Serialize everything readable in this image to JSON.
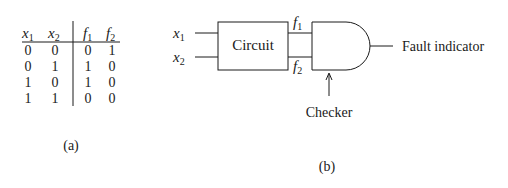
{
  "truth_table": {
    "headers": [
      {
        "var": "x",
        "sub": "1"
      },
      {
        "var": "x",
        "sub": "2"
      },
      {
        "var": "f",
        "sub": "1"
      },
      {
        "var": "f",
        "sub": "2"
      }
    ],
    "rows": [
      [
        "0",
        "0",
        "0",
        "1"
      ],
      [
        "0",
        "1",
        "1",
        "0"
      ],
      [
        "1",
        "0",
        "1",
        "0"
      ],
      [
        "1",
        "1",
        "0",
        "0"
      ]
    ],
    "caption": "(a)"
  },
  "circuit_diagram": {
    "inputs": [
      {
        "var": "x",
        "sub": "1"
      },
      {
        "var": "x",
        "sub": "2"
      }
    ],
    "circuit_label": "Circuit",
    "outputs": [
      {
        "var": "f",
        "sub": "1"
      },
      {
        "var": "f",
        "sub": "2"
      }
    ],
    "checker_label": "Checker",
    "output_label": "Fault indicator",
    "caption": "(b)"
  }
}
